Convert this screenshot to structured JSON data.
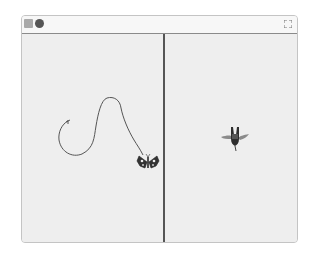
{
  "window": {
    "toolbar": {
      "green_flag_icon": "green-flag-icon",
      "stop_icon": "stop-icon",
      "fullscreen_icon": "fullscreen-icon"
    },
    "stages": [
      {
        "name": "left-stage",
        "sprite": "butterfly",
        "has_pen_trail": true
      },
      {
        "name": "right-stage",
        "sprite": "hummingbird",
        "has_pen_trail": false
      }
    ]
  },
  "colors": {
    "stage_bg": "#eeeeee",
    "divider": "#555555",
    "pen": "#555555"
  }
}
